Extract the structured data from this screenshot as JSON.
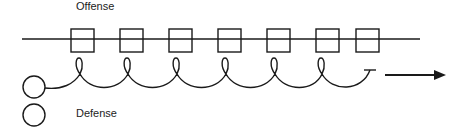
{
  "labels": {
    "offense": "Offense",
    "defense": "Defense"
  },
  "colors": {
    "stroke": "#1a1a1a",
    "background": "#ffffff"
  },
  "diagram": {
    "line": {
      "x1": 22,
      "x2": 420,
      "y": 39
    },
    "boxes": [
      {
        "x": 71,
        "y": 29,
        "w": 23,
        "h": 23
      },
      {
        "x": 120,
        "y": 29,
        "w": 23,
        "h": 23
      },
      {
        "x": 169,
        "y": 29,
        "w": 23,
        "h": 23
      },
      {
        "x": 218,
        "y": 29,
        "w": 23,
        "h": 23
      },
      {
        "x": 267,
        "y": 29,
        "w": 23,
        "h": 23
      },
      {
        "x": 316,
        "y": 29,
        "w": 23,
        "h": 23
      },
      {
        "x": 356,
        "y": 29,
        "w": 23,
        "h": 23
      }
    ],
    "circles": [
      {
        "cx": 34,
        "cy": 87,
        "r": 11
      },
      {
        "cx": 34,
        "cy": 115,
        "r": 11
      }
    ],
    "arrow": {
      "x1": 385,
      "x2": 445,
      "y": 75
    }
  }
}
